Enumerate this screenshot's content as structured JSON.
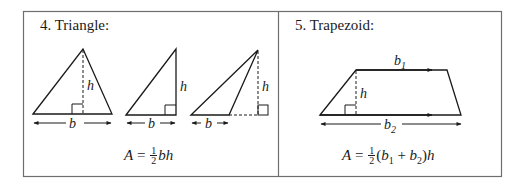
{
  "panels": [
    {
      "title": "4.  Triangle:",
      "formula": {
        "lhs": "A",
        "eq": "=",
        "frac_num": "1",
        "frac_den": "2",
        "rhs": "bh"
      },
      "labels": {
        "height": "h",
        "base": "b"
      }
    },
    {
      "title": "5.  Trapezoid:",
      "formula": {
        "lhs": "A",
        "eq": "=",
        "frac_num": "1",
        "frac_den": "2",
        "open": "(",
        "b1": "b",
        "b1_sub": "1",
        "plus": "+",
        "b2": "b",
        "b2_sub": "2",
        "close": ")",
        "rhs": "h"
      },
      "labels": {
        "height": "h",
        "top_base": "b",
        "top_base_sub": "1",
        "bottom_base": "b",
        "bottom_base_sub": "2"
      }
    }
  ],
  "colors": {
    "stroke": "#1a1a1a",
    "border": "#6e6e6e",
    "background": "#ffffff"
  }
}
